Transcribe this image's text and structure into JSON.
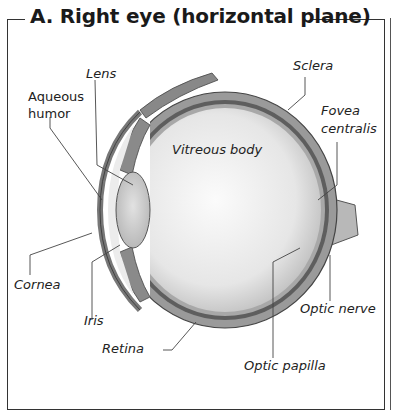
{
  "figure": {
    "title": "A.  Right eye (horizontal plane)",
    "labels": {
      "lens": "Lens",
      "sclera": "Sclera",
      "aqueous_humor_1": "Aqueous",
      "aqueous_humor_2": "humor",
      "fovea_centralis_1": "Fovea",
      "fovea_centralis_2": "centralis",
      "vitreous_body": "Vitreous body",
      "cornea": "Cornea",
      "iris": "Iris",
      "retina": "Retina",
      "optic_nerve": "Optic nerve",
      "optic_papilla": "Optic papilla"
    }
  }
}
